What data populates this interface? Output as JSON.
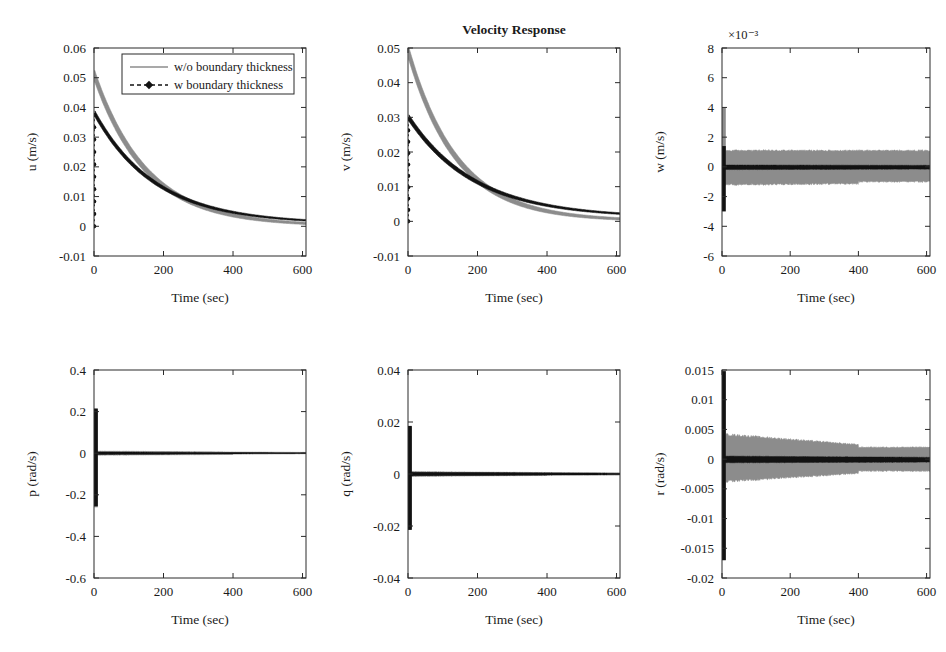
{
  "figure": {
    "title": "Velocity Response",
    "legend": {
      "entries": [
        {
          "label": "w/o boundary thickness",
          "style": "solid",
          "color": "#8c8c8c"
        },
        {
          "label": "w boundary thickness",
          "style": "dashed-marker",
          "color": "#121212"
        }
      ]
    },
    "colors": {
      "gray": "#8c8c8c",
      "black": "#121212",
      "axis": "#2a2a2a"
    }
  },
  "chart_data": [
    {
      "id": "u",
      "type": "line",
      "title": "",
      "xlabel": "Time (sec)",
      "ylabel": "u (m/s)",
      "xlim": [
        0,
        610
      ],
      "ylim": [
        -0.01,
        0.06
      ],
      "xticks": [
        0,
        200,
        400,
        600
      ],
      "xticklabels": [
        "0",
        "200",
        "400",
        "600"
      ],
      "yticks": [
        -0.01,
        0,
        0.01,
        0.02,
        0.03,
        0.04,
        0.05,
        0.06
      ],
      "yticklabels": [
        "-0.01",
        "0",
        "0.01",
        "0.02",
        "0.03",
        "0.04",
        "0.05",
        "0.06"
      ],
      "exponent": "",
      "grid": false,
      "series": [
        {
          "name": "w/o boundary thickness",
          "color": "#8c8c8c",
          "kind": "decay-band",
          "start": 0.05,
          "peak_t": 2,
          "tau": 150,
          "offset": 0.0,
          "band": 0.0022,
          "band_decay": 260
        },
        {
          "name": "w boundary thickness",
          "color": "#121212",
          "kind": "decay-band",
          "start": 0.0375,
          "peak_t": 3,
          "tau": 175,
          "offset": 0.0008,
          "band": 0.0012,
          "band_decay": 320,
          "spike_low": 0.0,
          "spike_high": 0.0375
        }
      ]
    },
    {
      "id": "v",
      "type": "line",
      "title": "Velocity Response",
      "xlabel": "Time (sec)",
      "ylabel": "v (m/s)",
      "xlim": [
        0,
        610
      ],
      "ylim": [
        -0.01,
        0.05
      ],
      "xticks": [
        0,
        200,
        400,
        600
      ],
      "xticklabels": [
        "0",
        "200",
        "400",
        "600"
      ],
      "yticks": [
        -0.01,
        0,
        0.01,
        0.02,
        0.03,
        0.04,
        0.05
      ],
      "yticklabels": [
        "-0.01",
        "0",
        "0.01",
        "0.02",
        "0.03",
        "0.04",
        "0.05"
      ],
      "exponent": "",
      "grid": false,
      "series": [
        {
          "name": "w/o boundary thickness",
          "color": "#8c8c8c",
          "kind": "decay-band",
          "start": 0.048,
          "peak_t": 2,
          "tau": 140,
          "offset": 0.0,
          "band": 0.0021,
          "band_decay": 250
        },
        {
          "name": "w boundary thickness",
          "color": "#121212",
          "kind": "decay-band",
          "start": 0.0295,
          "peak_t": 3,
          "tau": 190,
          "offset": 0.001,
          "band": 0.0011,
          "band_decay": 330,
          "spike_low": 0.0,
          "spike_high": 0.0295
        }
      ]
    },
    {
      "id": "w",
      "type": "line",
      "title": "",
      "xlabel": "Time (sec)",
      "ylabel": "w (m/s)",
      "xlim": [
        0,
        610
      ],
      "ylim": [
        -0.006,
        0.008
      ],
      "xticks": [
        0,
        200,
        400,
        600
      ],
      "xticklabels": [
        "0",
        "200",
        "400",
        "600"
      ],
      "yticks": [
        -0.006,
        -0.004,
        -0.002,
        0,
        0.002,
        0.004,
        0.006,
        0.008
      ],
      "yticklabels": [
        "-6",
        "-4",
        "-2",
        "0",
        "2",
        "4",
        "6",
        "8"
      ],
      "exponent": "×10⁻³",
      "grid": false,
      "series": [
        {
          "name": "w/o boundary thickness",
          "color": "#8c8c8c",
          "kind": "noise-band",
          "upper": 0.0011,
          "lower": -0.0012,
          "upper_end": 0.0011,
          "lower_end": -0.0011,
          "spike_high": 0.004,
          "spike_low": -0.0012,
          "step_t": 400,
          "step_lower_after": -0.001
        },
        {
          "name": "w boundary thickness",
          "color": "#121212",
          "kind": "noise-band",
          "upper": 0.00012,
          "lower": -0.00018,
          "upper_end": 0.0001,
          "lower_end": -0.00015,
          "spike_high": 0.0014,
          "spike_low": -0.003
        }
      ]
    },
    {
      "id": "p",
      "type": "line",
      "title": "",
      "xlabel": "Time (sec)",
      "ylabel": "p (rad/s)",
      "xlim": [
        0,
        610
      ],
      "ylim": [
        -0.6,
        0.4
      ],
      "xticks": [
        0,
        200,
        400,
        600
      ],
      "xticklabels": [
        "0",
        "200",
        "400",
        "600"
      ],
      "yticks": [
        -0.6,
        -0.4,
        -0.2,
        0,
        0.2,
        0.4
      ],
      "yticklabels": [
        "-0.6",
        "-0.4",
        "-0.2",
        "0",
        "0.2",
        "0.4"
      ],
      "exponent": "",
      "grid": false,
      "series": [
        {
          "name": "w/o boundary thickness",
          "color": "#8c8c8c",
          "kind": "noise-band",
          "upper": 0.01,
          "lower": -0.01,
          "upper_end": 0.004,
          "lower_end": -0.004,
          "spike_high": 0.21,
          "spike_low": -0.26,
          "step_t": 400,
          "step_lower_after": -0.002
        },
        {
          "name": "w boundary thickness",
          "color": "#121212",
          "kind": "noise-band",
          "upper": 0.006,
          "lower": -0.006,
          "upper_end": 0.002,
          "lower_end": -0.002,
          "spike_high": 0.215,
          "spike_low": -0.255
        }
      ]
    },
    {
      "id": "q",
      "type": "line",
      "title": "",
      "xlabel": "Time (sec)",
      "ylabel": "q (rad/s)",
      "xlim": [
        0,
        610
      ],
      "ylim": [
        -0.04,
        0.04
      ],
      "xticks": [
        0,
        200,
        400,
        600
      ],
      "xticklabels": [
        "0",
        "200",
        "400",
        "600"
      ],
      "yticks": [
        -0.04,
        -0.02,
        0,
        0.02,
        0.04
      ],
      "yticklabels": [
        "-0.04",
        "-0.02",
        "0",
        "0.02",
        "0.04"
      ],
      "exponent": "",
      "grid": false,
      "series": [
        {
          "name": "w/o boundary thickness",
          "color": "#8c8c8c",
          "kind": "noise-band",
          "upper": 0.0009,
          "lower": -0.0009,
          "upper_end": 0.0004,
          "lower_end": -0.0004,
          "spike_high": 0.018,
          "spike_low": -0.021,
          "step_t": 400,
          "step_lower_after": -0.0003
        },
        {
          "name": "w boundary thickness",
          "color": "#121212",
          "kind": "noise-band",
          "upper": 0.0007,
          "lower": -0.0007,
          "upper_end": 0.0003,
          "lower_end": -0.0003,
          "spike_high": 0.0185,
          "spike_low": -0.0215
        }
      ]
    },
    {
      "id": "r",
      "type": "line",
      "title": "",
      "xlabel": "Time (sec)",
      "ylabel": "r (rad/s)",
      "xlim": [
        0,
        610
      ],
      "ylim": [
        -0.02,
        0.015
      ],
      "xticks": [
        0,
        200,
        400,
        600
      ],
      "xticklabels": [
        "0",
        "200",
        "400",
        "600"
      ],
      "yticks": [
        -0.02,
        -0.015,
        -0.01,
        -0.005,
        0,
        0.005,
        0.01,
        0.015
      ],
      "yticklabels": [
        "-0.02",
        "-0.015",
        "-0.01",
        "-0.005",
        "0",
        "0.005",
        "0.01",
        "0.015"
      ],
      "exponent": "",
      "grid": false,
      "series": [
        {
          "name": "w/o boundary thickness",
          "color": "#8c8c8c",
          "kind": "noise-band",
          "upper": 0.0042,
          "lower": -0.0038,
          "upper_end": 0.0015,
          "lower_end": -0.0016,
          "spike_high": 0.0148,
          "spike_low": -0.017,
          "step_t": 400,
          "step_upper_after": 0.002,
          "step_lower_after": -0.002
        },
        {
          "name": "w boundary thickness",
          "color": "#121212",
          "kind": "noise-band",
          "upper": 0.0005,
          "lower": -0.0006,
          "upper_end": 0.0003,
          "lower_end": -0.0005,
          "spike_high": 0.0148,
          "spike_low": -0.017
        }
      ]
    }
  ]
}
